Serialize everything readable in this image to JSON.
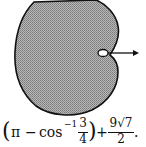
{
  "diagram": {
    "shape": "cardioid-like closed curve with shaded interior",
    "fill_color": "#9a9a9a",
    "outline_color": "#111111",
    "features": [
      "small hole near cusp",
      "arrow pointing right from hole"
    ]
  },
  "formula": {
    "open_paren": "(",
    "pi": "π",
    "minus": "−",
    "cos": "cos",
    "inverse": "−1",
    "frac1_num": "3",
    "frac1_den": "4",
    "close_paren": ")",
    "plus": "+",
    "frac2_num": "9√7",
    "frac2_den": "2",
    "period": "."
  }
}
